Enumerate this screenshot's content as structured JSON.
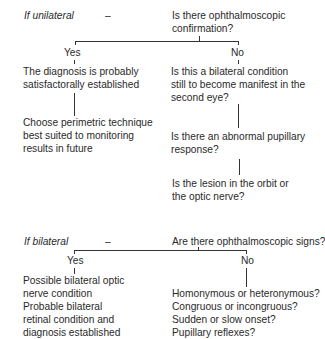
{
  "section_unilateral": {
    "condition": "If unilateral",
    "dash": "–",
    "question": [
      "Is there ophthalmoscopic",
      "confirmation?"
    ],
    "yes_label": "Yes",
    "no_label": "No",
    "yes_branch": {
      "result": [
        "The diagnosis is probably",
        "satisfactorally established"
      ],
      "next": [
        "Choose perimetric technique",
        "best suited to monitoring",
        "results in future"
      ]
    },
    "no_branch": {
      "q1": [
        "Is this a bilateral condition",
        "still to become manifest in the",
        "second eye?"
      ],
      "q2": [
        "Is there an abnormal pupillary",
        "response?"
      ],
      "q3": [
        "Is the lesion in the orbit or",
        "the optic nerve?"
      ]
    }
  },
  "section_bilateral": {
    "condition": "If bilateral",
    "dash": "–",
    "question": "Are there ophthalmoscopic signs?",
    "yes_label": "Yes",
    "no_label": "No",
    "yes_branch": {
      "result": [
        "Possible bilateral optic",
        "nerve condition",
        "Probable bilateral",
        "retinal condition and",
        "diagnosis established"
      ]
    },
    "no_branch": {
      "questions": [
        "Homonymous or heteronymous?",
        "Congruous or incongruous?",
        "Sudden or slow onset?",
        "Pupillary reflexes?"
      ]
    }
  }
}
